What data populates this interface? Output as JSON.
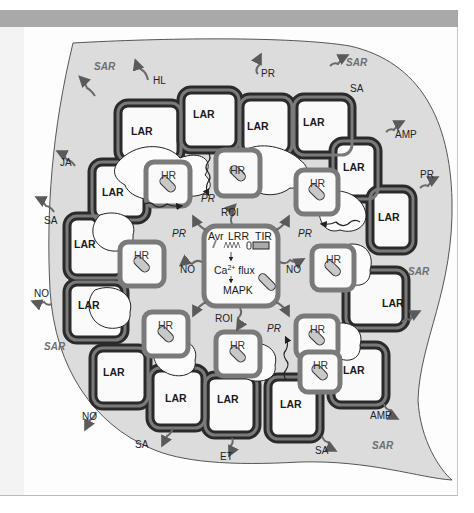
{
  "diagram": {
    "colors": {
      "background": "#ffffff",
      "leaf_fill": "#dcdcdc",
      "leaf_outline": "#555555",
      "cell_wall_dark": "#2a2a2a",
      "cell_wall_mid": "#6a6a6a",
      "hr_border": "#7a7a7a",
      "arrow": "#5a5a5a",
      "top_bar": "#a9a9a9"
    },
    "central_cell": {
      "labels": {
        "avr": "Avr",
        "lrr": "LRR",
        "tir": "TIR",
        "ca": "Ca",
        "ca_sup": "2+",
        "flux": " flux",
        "mapk": "MAPK"
      }
    },
    "signals": {
      "roi_top": "ROI",
      "roi_bottom": "ROI",
      "no_left": "NO",
      "no_right": "NO",
      "pr_top": "PR",
      "pr_left": "PR",
      "pr_right": "PR",
      "pr_bottom": "PR"
    },
    "hr_cells": [
      "HR",
      "HR",
      "HR",
      "HR",
      "HR",
      "HR",
      "HR",
      "HR",
      "HR"
    ],
    "lar_cells": [
      "LAR",
      "LAR",
      "LAR",
      "LAR",
      "LAR",
      "LAR",
      "LAR",
      "LAR",
      "LAR",
      "LAR",
      "LAR",
      "LAR",
      "LAR",
      "LAR",
      "LAR",
      "LAR"
    ],
    "outer_signals": {
      "sar_top_left": "SAR",
      "sar_top_right": "SAR",
      "sar_left": "SAR",
      "sar_right": "SAR",
      "sar_bottom_right": "SAR",
      "hl": "HL",
      "pr_top": "PR",
      "sa_top_right": "SA",
      "amp_right": "AMP",
      "pr_right": "PR",
      "ja": "JA",
      "sa_left": "SA",
      "no_left": "NO",
      "no_bottom_left": "NO",
      "sa_bottom": "SA",
      "et_bottom": "ET",
      "sa_bottom_right": "SA",
      "amp_bottom_right": "AMP"
    }
  }
}
